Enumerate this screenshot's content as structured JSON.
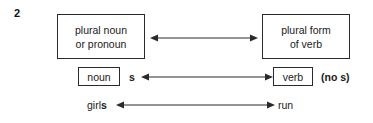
{
  "diagram": {
    "item_number": "2",
    "boxes": {
      "subject_box": {
        "name": "plural noun or pronoun",
        "lines": [
          "plural noun",
          "or pronoun"
        ]
      },
      "predicate_box": {
        "name": "plural form of verb",
        "lines": [
          "plural form",
          "of verb"
        ]
      },
      "noun_box": {
        "label": "noun"
      },
      "verb_box": {
        "label": "verb"
      }
    },
    "annotations": {
      "noun_suffix": "s",
      "verb_suffix_note": "(no s)"
    },
    "examples": {
      "subject_stem": "girl",
      "subject_suffix": "s",
      "verb_example": "run"
    },
    "arrows": [
      {
        "name": "subject-predicate-agreement-arrow",
        "direction": "bidirectional",
        "from": "plural noun or pronoun",
        "to": "plural form of verb"
      },
      {
        "name": "noun-verb-agreement-arrow",
        "direction": "bidirectional",
        "from": "noun",
        "to": "verb"
      },
      {
        "name": "example-agreement-arrow",
        "direction": "bidirectional",
        "from": "girls",
        "to": "run"
      }
    ],
    "colors": {
      "background": "#ffffff",
      "ink": "#1a1a1a",
      "stroke": "#2a2a2a"
    }
  }
}
